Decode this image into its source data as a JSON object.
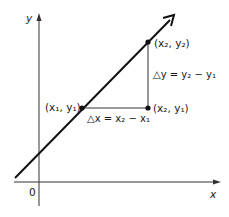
{
  "diagram": {
    "axes": {
      "x_label": "x",
      "y_label": "y",
      "origin_label": "0"
    },
    "points": [
      {
        "id": "p1",
        "label": "(x₁, y₁)"
      },
      {
        "id": "p2",
        "label": "(x₂, y₂)"
      },
      {
        "id": "p3",
        "label": "(x₂, y₁)"
      }
    ],
    "annotations": {
      "delta_x": "△x = x₂ − x₁",
      "delta_y": "△y = y₂ − y₁"
    },
    "colors": {
      "ink": "#1a1a1a",
      "background": "#ffffff"
    }
  }
}
